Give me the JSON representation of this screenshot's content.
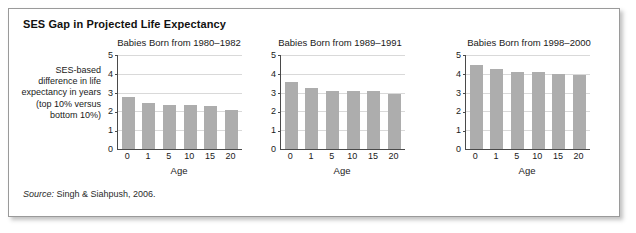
{
  "figure": {
    "title": "SES Gap in Projected Life Expectancy",
    "source_label": "Source:",
    "source_text": " Singh & Siahpush, 2006.",
    "y_caption": "SES-based difference in life expectancy in years (top 10% versus bottom 10%)",
    "bar_color": "#adadad",
    "grid_color": "#d9d9d9",
    "axis_color": "#4a4a4a",
    "border_color": "#9a9a9a"
  },
  "chart_data": [
    {
      "type": "bar",
      "title": "Babies Born from 1980–1982",
      "categories": [
        "0",
        "1",
        "5",
        "10",
        "15",
        "20"
      ],
      "values": [
        2.75,
        2.45,
        2.35,
        2.35,
        2.3,
        2.1
      ],
      "xlabel": "Age",
      "ylabel": "SES-based difference in life expectancy in years (top 10% versus bottom 10%)",
      "ylim": [
        0,
        5
      ],
      "yticks": [
        "0",
        "1",
        "2",
        "3",
        "4",
        "5"
      ],
      "grid": true,
      "legend": "none"
    },
    {
      "type": "bar",
      "title": "Babies Born from 1989–1991",
      "categories": [
        "0",
        "1",
        "5",
        "10",
        "15",
        "20"
      ],
      "values": [
        3.55,
        3.25,
        3.1,
        3.1,
        3.1,
        2.95
      ],
      "xlabel": "Age",
      "ylabel": "",
      "ylim": [
        0,
        5
      ],
      "yticks": [
        "0",
        "1",
        "2",
        "3",
        "4",
        "5"
      ],
      "grid": true,
      "legend": "none"
    },
    {
      "type": "bar",
      "title": "Babies Born from 1998–2000",
      "categories": [
        "0",
        "1",
        "5",
        "10",
        "15",
        "20"
      ],
      "values": [
        4.45,
        4.25,
        4.1,
        4.1,
        4.0,
        3.95
      ],
      "xlabel": "Age",
      "ylabel": "",
      "ylim": [
        0,
        5
      ],
      "yticks": [
        "0",
        "1",
        "2",
        "3",
        "4",
        "5"
      ],
      "grid": true,
      "legend": "none"
    }
  ]
}
